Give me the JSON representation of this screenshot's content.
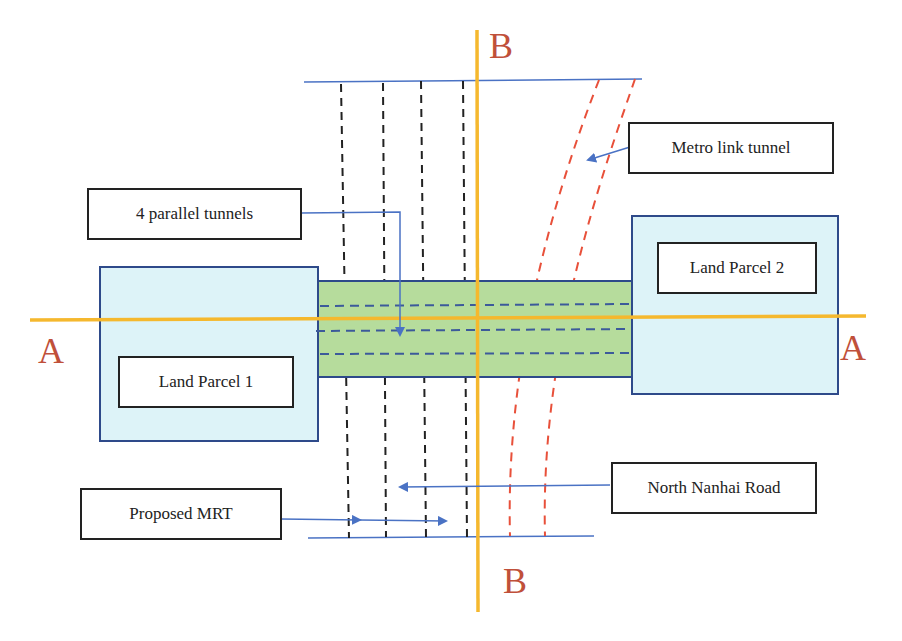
{
  "diagram": {
    "labels": {
      "metro_link_tunnel": "Metro link tunnel",
      "parallel_tunnels": "4 parallel tunnels",
      "land_parcel_1": "Land Parcel 1",
      "land_parcel_2": "Land Parcel 2",
      "north_nanhai_road": "North Nanhai Road",
      "proposed_mrt": "Proposed MRT"
    },
    "section_markers": {
      "a_left": "A",
      "a_right": "A",
      "b_top": "B",
      "b_bottom": "B"
    },
    "colors": {
      "section_line": "#f5b82e",
      "section_letter": "#c0503a",
      "road_line": "#4a72c4",
      "parcel_fill": "#ddf3f8",
      "parcel_border": "#2e4a8a",
      "tunnel_fill": "#b6dc9c",
      "metro_tunnel": "#e8503a",
      "mrt_dashes": "#222222",
      "arrow": "#4a72c4"
    }
  }
}
